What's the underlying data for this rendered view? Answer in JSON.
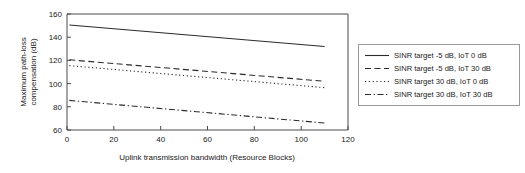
{
  "chart_data": {
    "type": "line",
    "title": "",
    "xlabel": "Uplink transmission bandwidth (Resource Blocks)",
    "ylabel": "Maximum path-loss compensation (dB)",
    "ylabel_line1": "Maximum path-loss",
    "ylabel_line2": "compensation (dB)",
    "xlim": [
      0,
      120
    ],
    "ylim": [
      60,
      160
    ],
    "xticks": [
      0,
      20,
      40,
      60,
      80,
      100,
      120
    ],
    "yticks": [
      60,
      80,
      100,
      120,
      140,
      160
    ],
    "xtick_labels": [
      "0",
      "20",
      "40",
      "60",
      "80",
      "100",
      "120"
    ],
    "ytick_labels": [
      "60",
      "80",
      "100",
      "120",
      "140",
      "160"
    ],
    "grid": false,
    "legend_position": "right-outside",
    "line_color": "#2b2b2b",
    "series": [
      {
        "name": "SINR target -5 dB, IoT 0 dB",
        "style": "solid",
        "x": [
          1,
          110
        ],
        "values": [
          150.5,
          132.0
        ]
      },
      {
        "name": "SINR target -5 dB, IoT 30 dB",
        "style": "dashed",
        "x": [
          1,
          110
        ],
        "values": [
          120.5,
          102.0
        ]
      },
      {
        "name": "SINR target 30 dB, IoT 0 dB",
        "style": "dotted",
        "x": [
          1,
          110
        ],
        "values": [
          115.5,
          96.5
        ]
      },
      {
        "name": "SINR target 30 dB, IoT 30 dB",
        "style": "dashdot",
        "x": [
          1,
          110
        ],
        "values": [
          85.5,
          66.0
        ]
      }
    ]
  },
  "legend": {
    "entries": [
      {
        "label": "SINR target -5 dB, IoT 0 dB",
        "style": "solid"
      },
      {
        "label": "SINR target -5 dB, IoT 30 dB",
        "style": "dashed"
      },
      {
        "label": "SINR target 30 dB, IoT 0 dB",
        "style": "dotted"
      },
      {
        "label": "SINR target 30 dB, IoT 30 dB",
        "style": "dashdot"
      }
    ]
  }
}
